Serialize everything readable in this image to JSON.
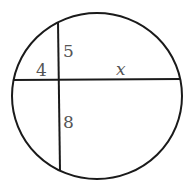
{
  "diagram": {
    "type": "intersecting-chords-in-circle",
    "stroke_color": "#1a1a1a",
    "label_color": "#555555",
    "labels": {
      "left_segment": "4",
      "right_segment": "x",
      "upper_segment": "5",
      "lower_segment": "8"
    }
  }
}
